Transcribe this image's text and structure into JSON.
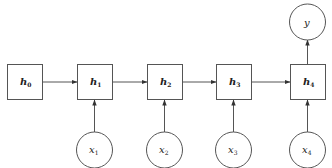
{
  "diagram": {
    "hidden_states": [
      {
        "id": "h0",
        "base": "h",
        "sub": "0"
      },
      {
        "id": "h1",
        "base": "h",
        "sub": "1"
      },
      {
        "id": "h2",
        "base": "h",
        "sub": "2"
      },
      {
        "id": "h3",
        "base": "h",
        "sub": "3"
      },
      {
        "id": "h4",
        "base": "h",
        "sub": "4"
      }
    ],
    "inputs": [
      {
        "id": "x1",
        "base": "x",
        "sub": "1"
      },
      {
        "id": "x2",
        "base": "x",
        "sub": "2"
      },
      {
        "id": "x3",
        "base": "x",
        "sub": "3"
      },
      {
        "id": "x4",
        "base": "x",
        "sub": "4"
      }
    ],
    "output": {
      "id": "y",
      "base": "y"
    },
    "edges": [
      {
        "from": "h0",
        "to": "h1"
      },
      {
        "from": "h1",
        "to": "h2"
      },
      {
        "from": "h2",
        "to": "h3"
      },
      {
        "from": "h3",
        "to": "h4"
      },
      {
        "from": "x1",
        "to": "h1"
      },
      {
        "from": "x2",
        "to": "h2"
      },
      {
        "from": "x3",
        "to": "h3"
      },
      {
        "from": "x4",
        "to": "h4"
      },
      {
        "from": "h4",
        "to": "y"
      }
    ],
    "colors": {
      "stroke": "#555555",
      "text": "#222222",
      "background": "#ffffff"
    }
  }
}
